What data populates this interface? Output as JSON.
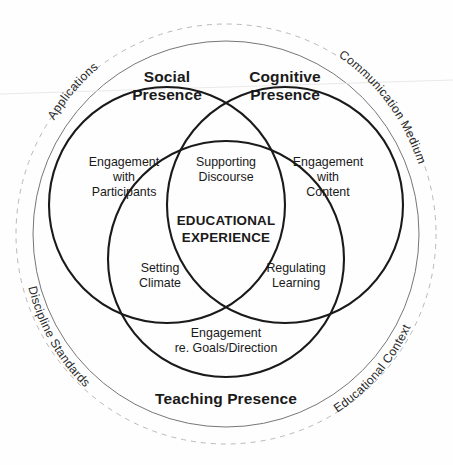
{
  "figure": {
    "center_label_line1": "EDUCATIONAL",
    "center_label_line2": "EXPERIENCE"
  },
  "presences": [
    {
      "id": "social",
      "label_line1": "Social",
      "label_line2": "Presence",
      "body_line1": "Engagement",
      "body_line2": "with",
      "body_line3": "Participants"
    },
    {
      "id": "cognitive",
      "label_line1": "Cognitive",
      "label_line2": "Presence",
      "body_line1": "Engagement",
      "body_line2": "with",
      "body_line3": "Content"
    },
    {
      "id": "teaching",
      "label_line1": "Teaching Presence",
      "label_line2": "",
      "body_line1": "Engagement",
      "body_line2": "re. Goals/Direction",
      "body_line3": ""
    }
  ],
  "intersections": [
    {
      "id": "social-cognitive",
      "line1": "Supporting",
      "line2": "Discourse"
    },
    {
      "id": "social-teaching",
      "line1": "Setting",
      "line2": "Climate"
    },
    {
      "id": "cognitive-teaching",
      "line1": "Regulating",
      "line2": "Learning"
    }
  ],
  "outer_arcs": [
    {
      "id": "applications",
      "label": "Applications"
    },
    {
      "id": "communication-medium",
      "label": "Communication Medium"
    },
    {
      "id": "educational-context",
      "label": "Educational Context"
    },
    {
      "id": "discipline-standards",
      "label": "Discipline Standards"
    }
  ],
  "colors": {
    "stroke_dark": "#1a1a1a",
    "ring_thin": "#777777",
    "ring_dashed": "#b9b9b9",
    "background": "#fefefe",
    "text": "#1a1a1a"
  }
}
